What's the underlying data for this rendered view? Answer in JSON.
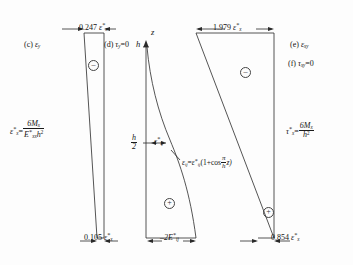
{
  "figure": {
    "background_color": "#fdfdfd",
    "line_color": "#2a2a2a"
  },
  "panels": {
    "left": {
      "caption_c": "(c)",
      "caption_c_symbol": "ε",
      "caption_c_sub": "y",
      "caption_d": "(d)",
      "caption_d_symbol": "τ",
      "caption_d_sub": "y",
      "caption_d_value": "=0",
      "top_value": "0.247",
      "top_value_symbol": "ε",
      "top_value_sub": "x",
      "bottom_value": "0.105",
      "bottom_value_symbol": "ε",
      "bottom_value_sub": "x",
      "formula_lhs_symbol": "ε",
      "formula_lhs_sub": "x",
      "formula_eq": "=",
      "formula_num": "6M",
      "formula_num_sub": "x",
      "formula_den_E": "E",
      "formula_den_E_sub": "xx",
      "formula_den_h": "h",
      "formula_den_h_exp": "2",
      "sign_marker": "–"
    },
    "middle": {
      "axis_z": "z",
      "axis_h": "h",
      "axis_half_num": "h",
      "axis_half_den": "2",
      "top_value": "1.979",
      "top_value_symbol": "ε",
      "top_value_sub": "x",
      "mid_label_symbol": "ε",
      "mid_label_sub": "ij",
      "curve_eq_lhs": "ε",
      "curve_eq_lhs_sub": "ij",
      "curve_eq_mid": "=",
      "curve_eq_rhs": "ε",
      "curve_eq_rhs_sub": "ij",
      "curve_eq_tail_open": "(1+cos",
      "curve_eq_frac_num": "π",
      "curve_eq_frac_den": "h",
      "curve_eq_tail_close": "z)",
      "bottom_value": "2E",
      "bottom_value_sub": "ij",
      "bottom_value_prefix": "–",
      "sign_marker": "+"
    },
    "right": {
      "caption_e": "(e)",
      "caption_e_symbol": "ε",
      "caption_e_sub": "xy",
      "caption_f": "(f)",
      "caption_f_symbol": "τ",
      "caption_f_sub": "xy",
      "caption_f_value": "=0",
      "bottom_value": "0.854",
      "bottom_value_symbol": "ε",
      "bottom_value_sub": "x",
      "formula_lhs_symbol": "τ",
      "formula_lhs_sub": "x",
      "formula_eq": "=",
      "formula_num": "6M",
      "formula_num_sub": "x",
      "formula_den_h": "h",
      "formula_den_h_exp": "2",
      "sign_marker_top": "–",
      "sign_marker_bottom": "+"
    }
  }
}
